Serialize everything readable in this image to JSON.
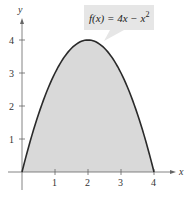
{
  "chart_data": {
    "type": "area",
    "title": "",
    "function": "f(x) = 4x - x^2",
    "annotation": {
      "text_prefix": "f(x) = 4x − x",
      "exponent": "2"
    },
    "xlabel": "x",
    "ylabel": "y",
    "xlim": [
      0,
      4.6
    ],
    "ylim": [
      0,
      4.6
    ],
    "x_ticks": [
      "1",
      "2",
      "3",
      "4"
    ],
    "y_ticks": [
      "1",
      "2",
      "3",
      "4"
    ],
    "grid": false,
    "legend": null,
    "shaded_region": "area under curve from x=0 to x=4",
    "x": [
      0,
      0.5,
      1,
      1.5,
      2,
      2.5,
      3,
      3.5,
      4
    ],
    "values": [
      0,
      1.75,
      3,
      3.75,
      4,
      3.75,
      3,
      1.75,
      0
    ],
    "colors": {
      "curve": "#2a2a2a",
      "fill": "#d9d9d9",
      "axis": "#555555",
      "annotation_box": "#e6e6e6"
    }
  }
}
